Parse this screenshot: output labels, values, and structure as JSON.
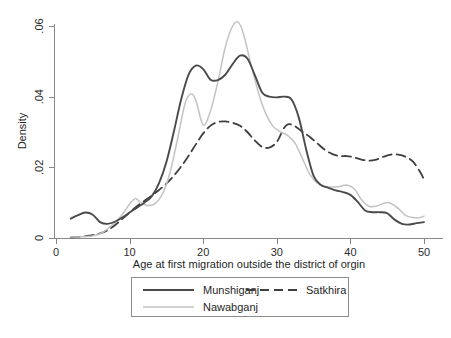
{
  "chart_data": {
    "type": "line",
    "title": "",
    "xlabel": "Age at first migration outside the district of orgin",
    "ylabel": "Density",
    "xlim": [
      0,
      51
    ],
    "ylim": [
      0,
      0.065
    ],
    "xticks": [
      0,
      10,
      20,
      30,
      40,
      50
    ],
    "xtick_labels": [
      "0",
      "10",
      "20",
      "30",
      "40",
      "50"
    ],
    "yticks": [
      0,
      0.02,
      0.04,
      0.06
    ],
    "ytick_labels": [
      "0",
      ".02",
      ".04",
      ".06"
    ],
    "grid": false,
    "legend_position": "below-axes",
    "series": [
      {
        "name": "Munshiganj",
        "color": "#4a4a4a",
        "dash": "solid",
        "width": 1.9,
        "x": [
          2.0,
          3.0,
          4.0,
          5.0,
          6.0,
          7.0,
          8.0,
          9.0,
          10.0,
          11.0,
          12.0,
          13.0,
          14.0,
          15.0,
          16.0,
          17.0,
          18.0,
          19.0,
          20.0,
          21.0,
          22.0,
          23.0,
          24.0,
          25.0,
          26.0,
          27.0,
          28.0,
          29.0,
          30.0,
          31.0,
          32.0,
          33.0,
          34.0,
          35.0,
          36.0,
          37.0,
          38.0,
          39.0,
          40.0,
          41.0,
          42.0,
          43.0,
          44.0,
          45.0,
          46.0,
          47.0,
          48.0,
          49.0,
          50.0
        ],
        "y": [
          0.0055,
          0.0065,
          0.0072,
          0.0066,
          0.0045,
          0.004,
          0.0046,
          0.0058,
          0.0072,
          0.0086,
          0.01,
          0.0118,
          0.0155,
          0.0215,
          0.03,
          0.0392,
          0.0462,
          0.0488,
          0.0478,
          0.0448,
          0.0447,
          0.0462,
          0.0492,
          0.0516,
          0.0508,
          0.0462,
          0.0412,
          0.04,
          0.0398,
          0.04,
          0.0392,
          0.034,
          0.025,
          0.0176,
          0.015,
          0.0142,
          0.0135,
          0.013,
          0.0122,
          0.0102,
          0.0078,
          0.0073,
          0.0073,
          0.007,
          0.0052,
          0.004,
          0.0038,
          0.0042,
          0.0045
        ],
        "peak_x": 25.0,
        "peak_y": 0.0516
      },
      {
        "name": "Nawabganj",
        "color": "#c3c3c3",
        "dash": "solid",
        "width": 1.5,
        "x": [
          2.0,
          3.0,
          4.0,
          5.0,
          6.0,
          7.0,
          8.0,
          9.0,
          10.0,
          10.8,
          11.5,
          12.5,
          13.5,
          14.5,
          15.5,
          16.5,
          17.5,
          18.3,
          19.0,
          20.0,
          21.0,
          22.0,
          23.0,
          24.0,
          24.8,
          25.5,
          26.5,
          27.5,
          28.5,
          29.5,
          30.5,
          31.5,
          32.5,
          33.5,
          34.5,
          35.5,
          36.5,
          37.5,
          38.5,
          39.5,
          40.5,
          41.5,
          42.5,
          43.5,
          44.5,
          45.3,
          46.5,
          47.5,
          48.5,
          49.5,
          50.0
        ],
        "y": [
          0.0003,
          0.0003,
          0.0004,
          0.0006,
          0.0012,
          0.0026,
          0.0044,
          0.0066,
          0.0096,
          0.0112,
          0.01,
          0.0092,
          0.0098,
          0.0126,
          0.0186,
          0.0278,
          0.0378,
          0.0408,
          0.039,
          0.032,
          0.036,
          0.0442,
          0.054,
          0.06,
          0.061,
          0.0576,
          0.049,
          0.0412,
          0.0352,
          0.0316,
          0.03,
          0.029,
          0.0268,
          0.0224,
          0.018,
          0.0155,
          0.0146,
          0.0144,
          0.0146,
          0.015,
          0.014,
          0.0108,
          0.009,
          0.009,
          0.0098,
          0.01,
          0.0084,
          0.0064,
          0.0058,
          0.0058,
          0.0062
        ],
        "peak_x": 24.8,
        "peak_y": 0.061
      },
      {
        "name": "Satkhira",
        "color": "#3f3f3f",
        "dash": "dashed",
        "width": 1.8,
        "x": [
          2.0,
          3.0,
          4.0,
          5.0,
          6.0,
          7.0,
          8.0,
          9.0,
          10.0,
          11.0,
          12.0,
          13.0,
          14.0,
          15.0,
          16.0,
          17.0,
          18.0,
          19.0,
          20.0,
          21.0,
          22.0,
          23.0,
          24.0,
          25.0,
          26.0,
          27.0,
          28.0,
          29.0,
          30.0,
          31.0,
          31.6,
          32.5,
          33.5,
          34.5,
          35.5,
          36.5,
          37.5,
          38.5,
          39.5,
          40.5,
          41.5,
          42.5,
          43.5,
          44.5,
          45.5,
          46.5,
          47.5,
          48.5,
          49.5,
          50.0
        ],
        "y": [
          0.0002,
          0.0003,
          0.0005,
          0.0008,
          0.0013,
          0.0022,
          0.0036,
          0.0054,
          0.0072,
          0.009,
          0.0105,
          0.012,
          0.0136,
          0.0154,
          0.0176,
          0.0202,
          0.0232,
          0.0265,
          0.0296,
          0.0318,
          0.0328,
          0.033,
          0.0326,
          0.0318,
          0.03,
          0.0276,
          0.0258,
          0.0256,
          0.0272,
          0.0312,
          0.0322,
          0.0316,
          0.03,
          0.0286,
          0.0268,
          0.025,
          0.0238,
          0.0232,
          0.0232,
          0.0228,
          0.0222,
          0.0219,
          0.0222,
          0.023,
          0.0236,
          0.0236,
          0.023,
          0.0216,
          0.0186,
          0.0165
        ],
        "peak_x": 23.0,
        "peak_y": 0.033
      }
    ]
  },
  "legend": {
    "items": [
      {
        "label": "Munshiganj",
        "series": "Munshiganj"
      },
      {
        "label": "Satkhira",
        "series": "Satkhira"
      },
      {
        "label": "Nawabganj",
        "series": "Nawabganj"
      }
    ]
  },
  "colors": {
    "munshiganj": "#4a4a4a",
    "nawabganj": "#c3c3c3",
    "satkhira": "#3f3f3f",
    "axis": "#888888",
    "background": "#ffffff"
  }
}
